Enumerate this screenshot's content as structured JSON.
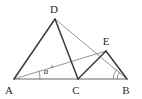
{
  "figure": {
    "stroke_color": "#3a3a3a",
    "baseline_color": "#9a9a9a",
    "thin_color": "#7a7a7a",
    "label_color": "#2b2b2b",
    "background": "#ffffff"
  },
  "points": {
    "A": {
      "label": "A",
      "x": 14,
      "y": 79,
      "label_x": 9,
      "label_y": 94
    },
    "B": {
      "label": "B",
      "x": 127,
      "y": 79,
      "label_x": 124,
      "label_y": 94
    },
    "C": {
      "label": "C",
      "x": 78,
      "y": 79,
      "label_x": 74,
      "label_y": 94
    },
    "D": {
      "label": "D",
      "x": 55,
      "y": 19,
      "label_x": 51,
      "label_y": 13
    },
    "E": {
      "label": "E",
      "x": 106,
      "y": 51,
      "label_x": 103,
      "label_y": 45
    }
  },
  "segments": [
    {
      "name": "segment-AB",
      "from": "A",
      "to": "B",
      "weight": "baseline"
    },
    {
      "name": "segment-AD",
      "from": "A",
      "to": "D",
      "weight": "thick"
    },
    {
      "name": "segment-DC",
      "from": "D",
      "to": "C",
      "weight": "thick"
    },
    {
      "name": "segment-DB",
      "from": "D",
      "to": "B",
      "weight": "thin"
    },
    {
      "name": "segment-AE",
      "from": "A",
      "to": "E",
      "weight": "thin"
    },
    {
      "name": "segment-CE",
      "from": "C",
      "to": "E",
      "weight": "thick"
    },
    {
      "name": "segment-EB",
      "from": "E",
      "to": "B",
      "weight": "thick"
    }
  ],
  "angles": [
    {
      "name": "angle-at-A",
      "vertex": "A",
      "label": "a",
      "degree_mark": "°",
      "label_x": 46,
      "label_y": 73,
      "arc_radius": 26
    },
    {
      "name": "angle-at-B",
      "vertex": "B",
      "label": "",
      "degree_mark": "",
      "arc_radius_inner": 10,
      "arc_radius_outer": 14
    }
  ]
}
